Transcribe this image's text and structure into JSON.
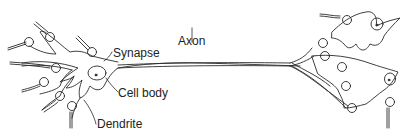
{
  "diagram": {
    "labels": {
      "synapse": "Synapse",
      "axon": "Axon",
      "cell_body": "Cell body",
      "dendrite": "Dendrite"
    },
    "stroke_color": "#2a2a2a",
    "background": "#ffffff"
  }
}
